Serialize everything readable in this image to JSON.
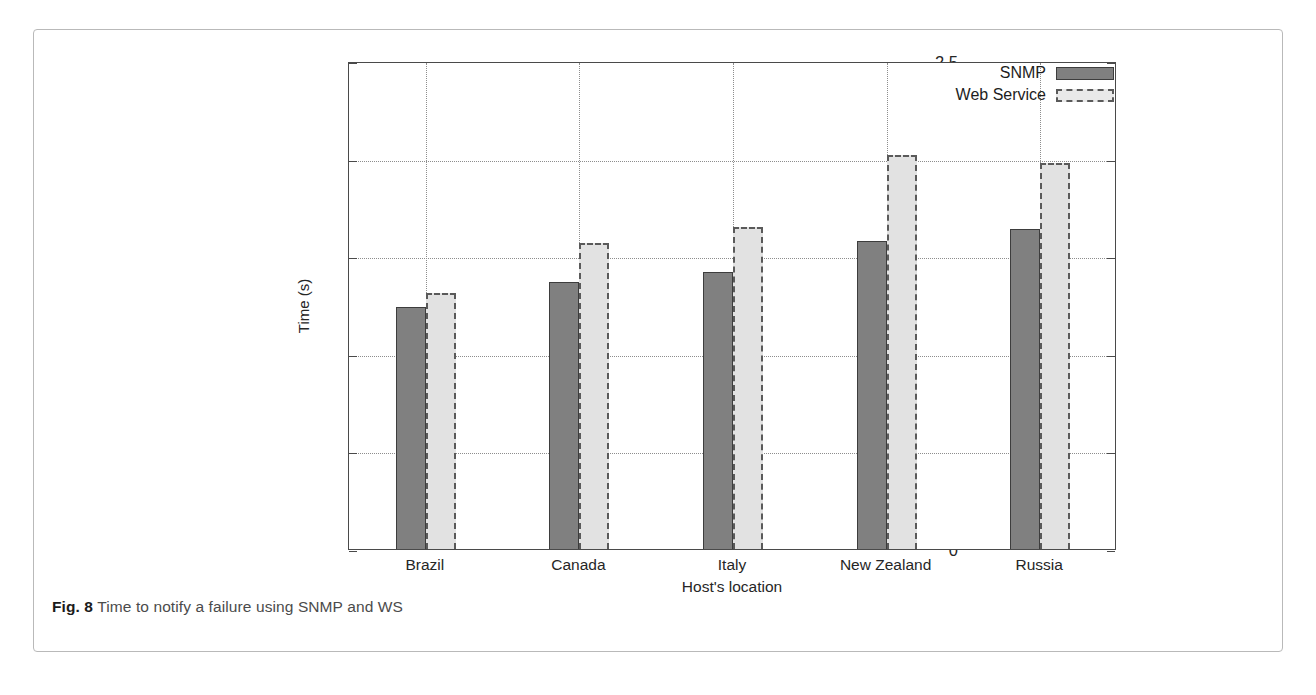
{
  "figure": {
    "caption_label": "Fig. 8",
    "caption_text": " Time to notify a failure using SNMP and WS"
  },
  "chart_data": {
    "type": "bar",
    "title": "",
    "xlabel": "Host's location",
    "ylabel": "Time (s)",
    "categories": [
      "Brazil",
      "Canada",
      "Italy",
      "New Zealand",
      "Russia"
    ],
    "series": [
      {
        "name": "SNMP",
        "values": [
          1.24,
          1.37,
          1.42,
          1.58,
          1.64
        ],
        "color": "#808080"
      },
      {
        "name": "Web Service",
        "values": [
          1.31,
          1.57,
          1.65,
          2.02,
          1.98
        ],
        "color": "#e2e2e2"
      }
    ],
    "ylim": [
      0,
      2.5
    ],
    "yticks": [
      0,
      0.5,
      1,
      1.5,
      2,
      2.5
    ],
    "ytick_labels": [
      "0",
      "0.5",
      "1",
      "1.5",
      "2",
      "2.5"
    ],
    "grid": true,
    "legend_position": "top-right"
  },
  "legend": {
    "entries": [
      {
        "label": "SNMP"
      },
      {
        "label": "Web Service"
      }
    ]
  }
}
